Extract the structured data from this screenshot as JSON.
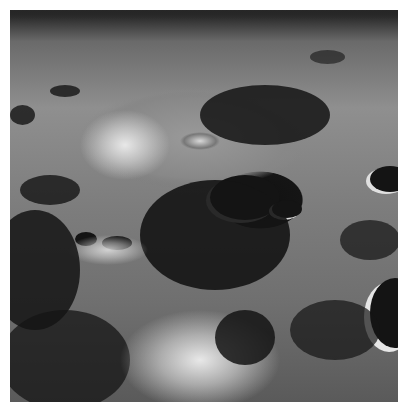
{
  "image": {
    "subject": "Oblique view of a cratered lunar surface in black and white",
    "alt": "Lunar surface with large central crater, smaller shadowed craters and bright crater rims",
    "palette": {
      "background": "#ffffff",
      "shadow": "#141414",
      "midtone": "#808080",
      "highlight": "#e8e8e8"
    }
  }
}
